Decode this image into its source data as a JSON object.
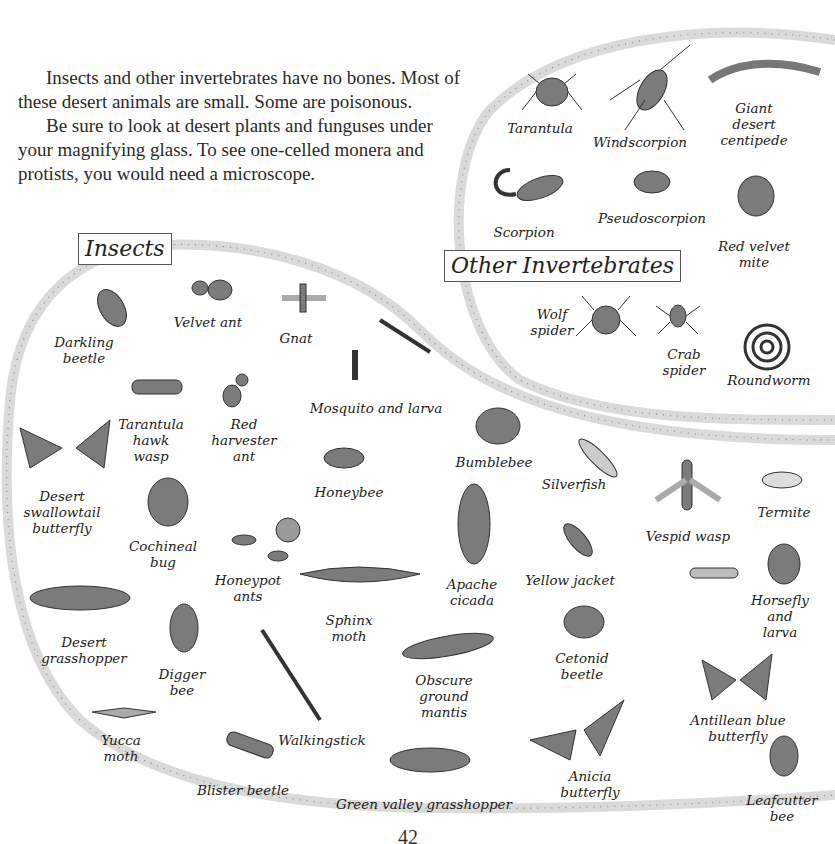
{
  "intro": {
    "paragraphs": [
      "Insects and other invertebrates have no bones. Most of these desert animals are small. Some are poisonous.",
      "Be sure to look at desert plants and funguses under your magnifying glass. To see one-celled monera and protists, you would need a microscope."
    ]
  },
  "sections": {
    "insects": {
      "heading": "Insects",
      "labels": [
        "Darkling\nbeetle",
        "Velvet ant",
        "Gnat",
        "Mosquito and larva",
        "Tarantula\nhawk\nwasp",
        "Red\nharvester\nant",
        "Desert\nswallowtail\nbutterfly",
        "Honeybee",
        "Bumblebee",
        "Silverfish",
        "Cochineal\nbug",
        "Honeypot\nants",
        "Apache\ncicada",
        "Yellow jacket",
        "Vespid wasp",
        "Termite",
        "Desert\ngrasshopper",
        "Sphinx\nmoth",
        "Horsefly\nand larva",
        "Digger\nbee",
        "Obscure\nground\nmantis",
        "Cetonid\nbeetle",
        "Yucca\nmoth",
        "Walkingstick",
        "Antillean blue\nbutterfly",
        "Blister beetle",
        "Anicia\nbutterfly",
        "Green valley grasshopper",
        "Leafcutter\nbee"
      ]
    },
    "other_invertebrates": {
      "heading": "Other Invertebrates",
      "labels": [
        "Tarantula",
        "Windscorpion",
        "Giant\ndesert\ncentipede",
        "Scorpion",
        "Pseudoscorpion",
        "Red velvet\nmite",
        "Wolf\nspider",
        "Crab\nspider",
        "Roundworm"
      ]
    }
  },
  "footer": {
    "page_number": "42"
  },
  "colors": {
    "border_band": "#d9d9d9",
    "border_dots": "#8a8a8a",
    "ink": "#3a3a3a",
    "body_fill": "#8a8a8a"
  }
}
